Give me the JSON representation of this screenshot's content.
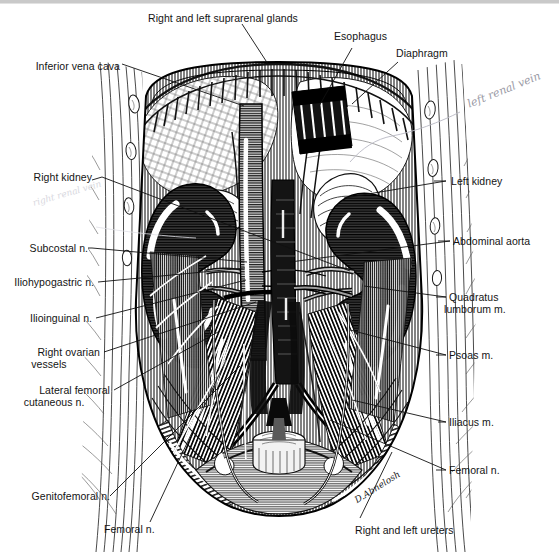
{
  "figure": {
    "artist_signature": "D.Abnelosh",
    "border_color": "#c9c9c9",
    "ink_color": "#111111",
    "paper_color": "#ffffff",
    "kidney_tone": "#3a3a3a",
    "vessel_tone": "#8d8d8d"
  },
  "labels": {
    "suprarenal_glands": "Right and left suprarenal glands",
    "esophagus": "Esophagus",
    "diaphragm": "Diaphragm",
    "inferior_vena_cava": "Inferior vena cava",
    "right_kidney": "Right kidney",
    "subcostal_n": "Subcostal n.",
    "iliohypogastric_n": "Iliohypogastric n.",
    "ilioinguinal_n": "Ilioinguinal n.",
    "right_ovarian_vessels_l1": "Right ovarian",
    "right_ovarian_vessels_l2": "vessels",
    "lateral_femoral_cutaneous_l1": "Lateral femoral",
    "lateral_femoral_cutaneous_l2": "cutaneous n.",
    "genitofemoral_n": "Genitofemoral n.",
    "femoral_n_bottom": "Femoral n.",
    "right_and_left_ureters": "Right and left ureters",
    "left_kidney": "Left kidney",
    "abdominal_aorta": "Abdominal aorta",
    "quadratus_lumborum_l1": "Quadratus",
    "quadratus_lumborum_l2": "lumborum m.",
    "psoas_m": "Psoas m.",
    "iliacus_m": "Iliacus m.",
    "femoral_n_right": "Femoral n."
  },
  "annotations": {
    "left_renal_vein": "left renal vein",
    "right_renal_vein": "right renal vein"
  }
}
